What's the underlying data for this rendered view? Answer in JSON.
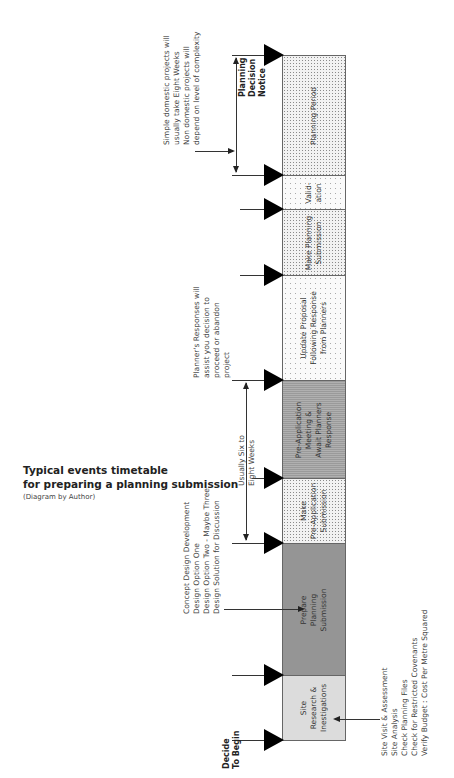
{
  "title": {
    "line1": "Typical events timetable",
    "line2": "for preparing a planning submission",
    "caption": "(Diagram by Author)"
  },
  "stages": [
    {
      "id": "site-research",
      "label": "Site\nResearch &\nInestigations",
      "pattern": "light",
      "top": 675,
      "bottom": 740
    },
    {
      "id": "prepare-planning",
      "label": "Prepare\nPlanning\nSubmission",
      "pattern": "dense",
      "top": 543,
      "bottom": 675
    },
    {
      "id": "make-preapp",
      "label": "Make\nPre-Application\nSubmission",
      "pattern": "fine",
      "top": 478,
      "bottom": 543
    },
    {
      "id": "preapp-meeting",
      "label": "Pre-Application\nMeeting &\nAwait Planners\nResponse",
      "pattern": "dark",
      "top": 380,
      "bottom": 478
    },
    {
      "id": "update-proposal",
      "label": "Update Proposal\nFollowing Response\nfrom Planners",
      "pattern": "sparse",
      "top": 275,
      "bottom": 380
    },
    {
      "id": "make-planning",
      "label": "Make Planning\nSubmission",
      "pattern": "fine",
      "top": 209,
      "bottom": 275
    },
    {
      "id": "validation",
      "label": "Valid-\nation",
      "pattern": "sparse",
      "top": 175,
      "bottom": 209
    },
    {
      "id": "planning-period",
      "label": "Planning Period",
      "pattern": "fine",
      "top": 55,
      "bottom": 175
    }
  ],
  "milestones": {
    "decide_to_begin": "Decide\nTo Begin",
    "planning_decision_notice": "Planning\nDecision\nNotice"
  },
  "notes": {
    "site_research": "Site Visit & Assessment\nSite Analysis\nCheck Planning Files\nCheck for Restricted Covenants\nVerify Budget : Cost Per Metre Squared",
    "concept_design": "Concept Design Development\nDesign Option One\nDesign Option Two - Maybe Three\nDesign Solution for Discussion",
    "six_to_eight": "Usually Six to\nEight Weeks",
    "planners_responses": "Planner's Responses will\nassist you decision to\nproceed or abandon\nproject",
    "planning_period": "Simple domestic projects will\nusually take Eight Weeks\nNon domestic projects will\ndepend on level of complexity"
  },
  "colors": {
    "marker": "#000000",
    "line": "#333333",
    "bar_border": "#666666"
  }
}
